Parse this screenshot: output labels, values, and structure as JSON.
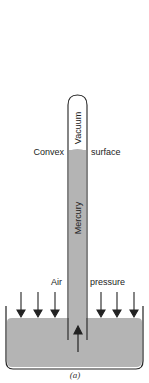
{
  "diagram": {
    "labels": {
      "vacuum": "Vacuum",
      "mercury": "Mercury",
      "convex": "Convex",
      "surface": "surface",
      "air": "Air",
      "pressure": "pressure",
      "caption": "(a)"
    },
    "colors": {
      "mercury": "#b4b4b4",
      "outline": "#222222",
      "background": "#ffffff"
    },
    "arrows": {
      "air_pressure_down_count": 6,
      "mercury_push_up_count": 1
    }
  }
}
